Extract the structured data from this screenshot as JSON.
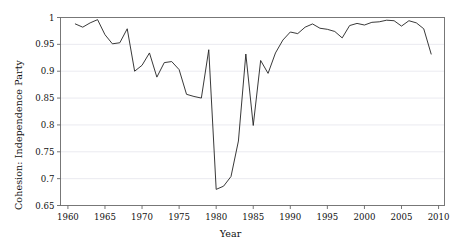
{
  "chart_data": {
    "type": "line",
    "title": "",
    "subtitle": "",
    "xlabel": "Year",
    "ylabel": "Cohesion: Independence Party",
    "xlim": [
      1959.0,
      2010.8
    ],
    "ylim": [
      0.65,
      1.0
    ],
    "xticks": [
      1960,
      1965,
      1970,
      1975,
      1980,
      1985,
      1990,
      1995,
      2000,
      2005,
      2010
    ],
    "xtick_labels": [
      "1960",
      "1965",
      "1970",
      "1975",
      "1980",
      "1985",
      "1990",
      "1995",
      "2000",
      "2005",
      "2010"
    ],
    "yticks": [
      0.65,
      0.7,
      0.75,
      0.8,
      0.85,
      0.9,
      0.95,
      1.0
    ],
    "ytick_labels": [
      "0.65",
      "0.7",
      "0.75",
      "0.8",
      "0.85",
      "0.9",
      "0.95",
      "1"
    ],
    "grid": true,
    "grid_axis": "y",
    "grid_color": "#e8e8ee",
    "legend": false,
    "legend_position": "none",
    "line_color": "#222222",
    "line_width": 0.9,
    "markers": false,
    "frame": true,
    "frame_color": "#777777",
    "background": "#ffffff",
    "series": [
      {
        "name": "Cohesion: Independence Party",
        "x": [
          1961,
          1962,
          1963,
          1964,
          1965,
          1966,
          1967,
          1968,
          1969,
          1970,
          1971,
          1972,
          1973,
          1974,
          1975,
          1976,
          1977,
          1978,
          1979,
          1980,
          1981,
          1982,
          1983,
          1984,
          1985,
          1986,
          1987,
          1988,
          1989,
          1990,
          1991,
          1992,
          1993,
          1994,
          1995,
          1996,
          1997,
          1998,
          1999,
          2000,
          2001,
          2002,
          2003,
          2004,
          2005,
          2006,
          2007,
          2008,
          2009
        ],
        "y": [
          0.988,
          0.982,
          0.99,
          0.996,
          0.968,
          0.951,
          0.953,
          0.979,
          0.9,
          0.911,
          0.934,
          0.889,
          0.916,
          0.918,
          0.903,
          0.857,
          0.853,
          0.85,
          0.94,
          0.68,
          0.686,
          0.704,
          0.77,
          0.932,
          0.799,
          0.92,
          0.896,
          0.934,
          0.958,
          0.973,
          0.97,
          0.982,
          0.988,
          0.98,
          0.978,
          0.974,
          0.962,
          0.985,
          0.989,
          0.986,
          0.991,
          0.992,
          0.995,
          0.994,
          0.984,
          0.994,
          0.99,
          0.979,
          0.932
        ]
      }
    ]
  }
}
